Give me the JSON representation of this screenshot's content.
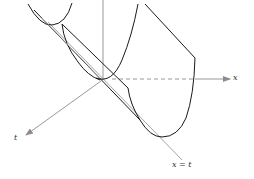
{
  "figure": {
    "type": "3d-surface-sketch",
    "colors": {
      "curve": "#1a1a1a",
      "axis": "#8c8c8c",
      "guide_line": "#9a9a9a"
    },
    "axes": {
      "x_label": "x",
      "t_label": "t",
      "vertical_axis": ""
    },
    "annotations": {
      "line_label": "x = t"
    }
  }
}
